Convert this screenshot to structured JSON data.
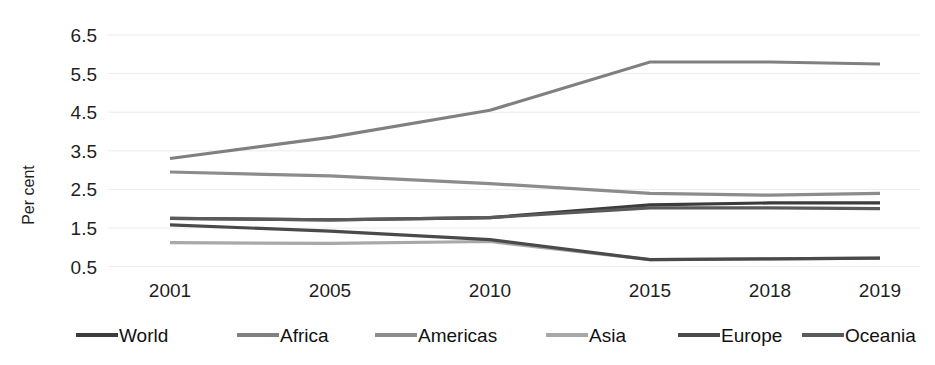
{
  "chart_data": {
    "type": "line",
    "title": "",
    "subtitle": "",
    "xlabel": "",
    "ylabel": "Per cent",
    "categories": [
      "2001",
      "2005",
      "2010",
      "2015",
      "2018",
      "2019"
    ],
    "x": [
      2001,
      2005,
      2010,
      2015,
      2018,
      2019
    ],
    "yticks": [
      0.5,
      1.5,
      2.5,
      3.5,
      4.5,
      5.5,
      6.5
    ],
    "ytick_labels": [
      "0.5",
      "1.5",
      "2.5",
      "3.5",
      "4.5",
      "5.5",
      "6.5"
    ],
    "ylim": [
      0.1,
      6.9
    ],
    "grid": true,
    "grid_axis": "y",
    "legend_position": "bottom",
    "series": [
      {
        "name": "World",
        "color": "#3c3c3c",
        "values": [
          1.75,
          1.71,
          1.77,
          2.1,
          2.15,
          2.15
        ]
      },
      {
        "name": "Africa",
        "color": "#808080",
        "values": [
          3.3,
          3.85,
          4.55,
          5.8,
          5.8,
          5.75
        ]
      },
      {
        "name": "Americas",
        "color": "#8c8c8c",
        "values": [
          2.95,
          2.85,
          2.65,
          2.4,
          2.35,
          2.4
        ]
      },
      {
        "name": "Asia",
        "color": "#a8a8a8",
        "values": [
          1.12,
          1.1,
          1.15,
          0.68,
          0.7,
          0.72
        ]
      },
      {
        "name": "Europe",
        "color": "#4a4a4a",
        "values": [
          1.58,
          1.42,
          1.2,
          0.68,
          0.7,
          0.72
        ]
      },
      {
        "name": "Oceania",
        "color": "#5a5a5a",
        "values": [
          1.75,
          1.71,
          1.77,
          2.02,
          2.02,
          2.0
        ]
      }
    ]
  },
  "axis": {
    "y_title": "Per cent",
    "y_ticks": [
      "6.5",
      "5.5",
      "4.5",
      "3.5",
      "2.5",
      "1.5",
      "0.5"
    ],
    "x_ticks": [
      "2001",
      "2005",
      "2010",
      "2015",
      "2018",
      "2019"
    ]
  },
  "legend": {
    "items": [
      {
        "label": "World",
        "color": "#3c3c3c"
      },
      {
        "label": "Africa",
        "color": "#808080"
      },
      {
        "label": "Americas",
        "color": "#8c8c8c"
      },
      {
        "label": "Asia",
        "color": "#a8a8a8"
      },
      {
        "label": "Europe",
        "color": "#4a4a4a"
      },
      {
        "label": "Oceania",
        "color": "#5a5a5a"
      }
    ]
  },
  "style": {
    "background": "#ffffff",
    "gridline_color": "#ececec",
    "text_color": "#1f1f1f"
  }
}
